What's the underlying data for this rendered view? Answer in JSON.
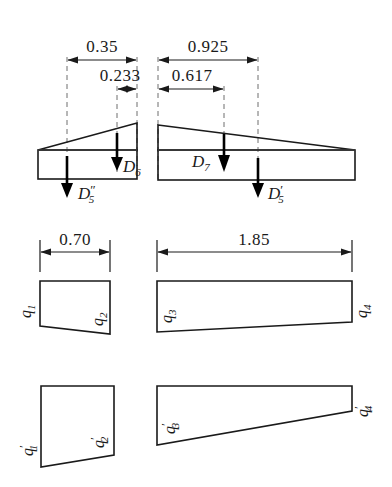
{
  "figure": {
    "dimension_unit": "m",
    "stroke_color": "#1a1a1a",
    "dashed_color": "#6e6e6e",
    "background": "#ffffff"
  },
  "rows": [
    {
      "name": "top-row",
      "panels": [
        {
          "name": "panel-d5-d6",
          "dimensions": [
            {
              "id": "dim-0-35",
              "value": "0.35"
            },
            {
              "id": "dim-0-233",
              "value": "0.233"
            }
          ],
          "forces": [
            {
              "id": "force-d6",
              "symbol": "D",
              "sub": "6",
              "prime": ""
            },
            {
              "id": "force-d5-double-prime",
              "symbol": "D",
              "sub": "5",
              "prime": "″"
            }
          ]
        },
        {
          "name": "panel-d5-d7",
          "dimensions": [
            {
              "id": "dim-0-925",
              "value": "0.925"
            },
            {
              "id": "dim-0-617",
              "value": "0.617"
            }
          ],
          "forces": [
            {
              "id": "force-d7",
              "symbol": "D",
              "sub": "7",
              "prime": ""
            },
            {
              "id": "force-d5-prime",
              "symbol": "D",
              "sub": "5",
              "prime": "′"
            }
          ]
        }
      ]
    },
    {
      "name": "middle-row",
      "panels": [
        {
          "name": "panel-q1-q2",
          "dimension": {
            "id": "dim-0-70",
            "value": "0.70"
          },
          "loads": [
            {
              "id": "q1",
              "symbol": "q",
              "sub": "1",
              "prime": ""
            },
            {
              "id": "q2",
              "symbol": "q",
              "sub": "2",
              "prime": ""
            }
          ]
        },
        {
          "name": "panel-q3-q4",
          "dimension": {
            "id": "dim-1-85",
            "value": "1.85"
          },
          "loads": [
            {
              "id": "q3",
              "symbol": "q",
              "sub": "3",
              "prime": ""
            },
            {
              "id": "q4",
              "symbol": "q",
              "sub": "4",
              "prime": ""
            }
          ]
        }
      ]
    },
    {
      "name": "bottom-row",
      "panels": [
        {
          "name": "panel-q1p-q2p",
          "loads": [
            {
              "id": "q1-prime",
              "symbol": "q",
              "sub": "1",
              "prime": "′"
            },
            {
              "id": "q2-prime",
              "symbol": "q",
              "sub": "2",
              "prime": "′"
            }
          ]
        },
        {
          "name": "panel-q3p-q4p",
          "loads": [
            {
              "id": "q3-prime",
              "symbol": "q",
              "sub": "3",
              "prime": "′"
            },
            {
              "id": "q4-prime",
              "symbol": "q",
              "sub": "4",
              "prime": "′"
            }
          ]
        }
      ]
    }
  ],
  "labels": {
    "d35": "0.35",
    "d233": "0.233",
    "d925": "0.925",
    "d617": "0.617",
    "d070": "0.70",
    "d185": "1.85",
    "D": "D",
    "q": "q",
    "s5": "5",
    "s6": "6",
    "s7": "7",
    "s1": "1",
    "s2": "2",
    "s3": "3",
    "s4": "4",
    "prime_single": "′",
    "prime_double": "″"
  }
}
